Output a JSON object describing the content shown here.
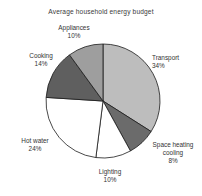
{
  "chart_data": {
    "type": "pie",
    "title": "Average household energy budget",
    "xlabel": "",
    "ylabel": "",
    "legend_position": "none",
    "grid": false,
    "units": "percent",
    "total": 100,
    "categories": [
      "Transport",
      "Space heating cooling",
      "Lighting",
      "Hot water",
      "Cooking",
      "Appliances"
    ],
    "values": [
      34,
      8,
      10,
      24,
      14,
      10
    ],
    "slices": [
      {
        "label": "Transport",
        "value": 34,
        "value_text": "34%",
        "color": "#bdbdbd",
        "start_angle_deg": 0,
        "end_angle_deg": 122.4
      },
      {
        "label_line_1": "Space heating",
        "label_line_2": "cooling",
        "label": "Space heating cooling",
        "value": 8,
        "value_text": "8%",
        "color": "#6b6b6b",
        "start_angle_deg": 122.4,
        "end_angle_deg": 151.2
      },
      {
        "label": "Lighting",
        "value": 10,
        "value_text": "10%",
        "color": "#ffffff",
        "start_angle_deg": 151.2,
        "end_angle_deg": 187.2
      },
      {
        "label": "Hot water",
        "value": 24,
        "value_text": "24%",
        "color": "#ffffff",
        "start_angle_deg": 187.2,
        "end_angle_deg": 273.6
      },
      {
        "label": "Cooking",
        "value": 14,
        "value_text": "14%",
        "color": "#5f5f5f",
        "start_angle_deg": 273.6,
        "end_angle_deg": 324.0
      },
      {
        "label": "Appliances",
        "value": 10,
        "value_text": "10%",
        "color": "#9e9e9e",
        "start_angle_deg": 324.0,
        "end_angle_deg": 360.0
      }
    ],
    "geometry": {
      "center_x": 103,
      "center_y": 101,
      "radius": 57
    },
    "style": {
      "outline_color": "#1a1a1a",
      "outline_width": 0.8,
      "background": "#ffffff",
      "text_color": "#333333"
    }
  }
}
